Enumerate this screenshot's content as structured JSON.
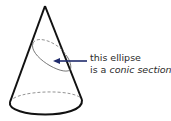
{
  "figure": {
    "annotation": {
      "line1": "this ellipse",
      "line2_prefix": "is a ",
      "line2_italic": "conic section"
    },
    "colors": {
      "cone_outline": "#111111",
      "dashed_lines": "#777777",
      "arrow": "#1f2a6b",
      "text": "#2a2a2a"
    }
  }
}
